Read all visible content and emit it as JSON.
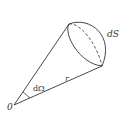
{
  "diagram": {
    "type": "solid-angle-cone",
    "labels": {
      "area_element": "dS",
      "solid_angle": "dΩ",
      "radius": "r",
      "origin": "0"
    },
    "colors": {
      "stroke": "#333333",
      "background": "#ffffff"
    }
  }
}
